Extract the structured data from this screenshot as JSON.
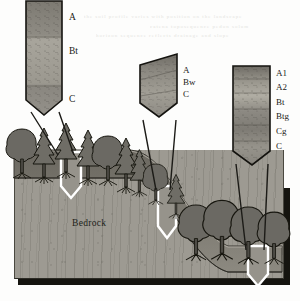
{
  "figure": {
    "kind": "soil-catena-block-diagram",
    "bedrock_label": "Bedrock",
    "background_color": "#fdfdfc",
    "bedrock_color": "#9d9a92",
    "soil_color": "#7e7b73",
    "ink_color": "#1b1a16"
  },
  "profiles": [
    {
      "id": "summit-profile",
      "position": "summit",
      "horizons": [
        {
          "code": "A",
          "label": "A"
        },
        {
          "code": "Bt",
          "label": "Bt"
        },
        {
          "code": "C",
          "label": "C"
        }
      ]
    },
    {
      "id": "backslope-profile",
      "position": "backslope",
      "horizons": [
        {
          "code": "A",
          "label": "A"
        },
        {
          "code": "Bw",
          "label": "Bw"
        },
        {
          "code": "C",
          "label": "C"
        }
      ]
    },
    {
      "id": "footslope-profile",
      "position": "footslope",
      "horizons": [
        {
          "code": "A1",
          "label": "A1"
        },
        {
          "code": "A2",
          "label": "A2"
        },
        {
          "code": "Bt",
          "label": "Bt"
        },
        {
          "code": "Btg",
          "label": "Btg"
        },
        {
          "code": "Cg",
          "label": "Cg"
        },
        {
          "code": "C",
          "label": "C"
        }
      ]
    }
  ],
  "pits": [
    {
      "id": "pit-summit",
      "landform": "summit"
    },
    {
      "id": "pit-backslope",
      "landform": "backslope"
    },
    {
      "id": "pit-footslope",
      "landform": "footslope"
    }
  ],
  "bleed_text": [
    "the soil profile varies with position on the landscape",
    "horizon sequence reflects drainage and slope",
    "catena  toposequence  pedon  solum"
  ]
}
